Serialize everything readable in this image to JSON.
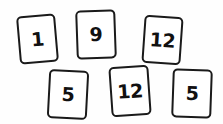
{
  "scene": {
    "title": "Number cards layout",
    "background_color": "#fefefe",
    "card_fill_color": "#ffffff",
    "card_border_color": "#1a1a1a",
    "digit_color": "#111111",
    "card_count": 6
  },
  "cards": [
    {
      "id": "card-1",
      "value": "1",
      "row": "top",
      "position_index": 1,
      "x": 18,
      "y": 15,
      "width": 39,
      "height": 48,
      "rotation_deg": -5
    },
    {
      "id": "card-2",
      "value": "9",
      "row": "top",
      "position_index": 2,
      "x": 76,
      "y": 10,
      "width": 40,
      "height": 49,
      "rotation_deg": -2
    },
    {
      "id": "card-3",
      "value": "12",
      "row": "top",
      "position_index": 3,
      "x": 143,
      "y": 16,
      "width": 39,
      "height": 48,
      "rotation_deg": 4
    },
    {
      "id": "card-4",
      "value": "5",
      "row": "bottom",
      "position_index": 1,
      "x": 48,
      "y": 70,
      "width": 40,
      "height": 49,
      "rotation_deg": 3
    },
    {
      "id": "card-5",
      "value": "12",
      "row": "bottom",
      "position_index": 2,
      "x": 110,
      "y": 66,
      "width": 40,
      "height": 50,
      "rotation_deg": -4
    },
    {
      "id": "card-6",
      "value": "5",
      "row": "bottom",
      "position_index": 3,
      "x": 172,
      "y": 69,
      "width": 40,
      "height": 49,
      "rotation_deg": 2
    }
  ]
}
